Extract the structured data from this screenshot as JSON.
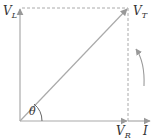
{
  "diagram": {
    "type": "phasor-diagram",
    "colors": {
      "axis": "#aaaaaa",
      "vector": "#aaaaaa",
      "dashed": "#aaaaaa",
      "text": "#333333"
    },
    "labels": {
      "vl": {
        "main": "V",
        "sub": "L"
      },
      "vt": {
        "main": "V",
        "sub": "T"
      },
      "vr": {
        "main": "V",
        "sub": "R"
      },
      "i": "I",
      "theta": "θ"
    },
    "elements": {
      "inductor_voltage_vector": "V_L (vertical, up)",
      "resistor_voltage_vector": "V_R (horizontal, right)",
      "current_vector": "I (horizontal, right, in phase with V_R)",
      "total_voltage_vector": "V_T (diagonal resultant)",
      "phase_angle": "θ between I/V_R and V_T",
      "rotation_arrow": "counter-clockwise rotation indicator"
    }
  }
}
